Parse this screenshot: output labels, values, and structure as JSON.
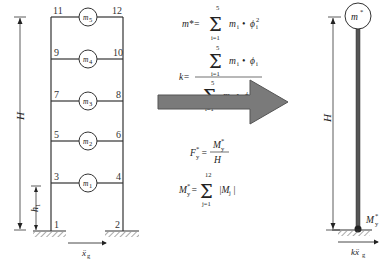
{
  "diagram": {
    "left_frame": {
      "node_labels": [
        "1",
        "2",
        "3",
        "4",
        "5",
        "6",
        "7",
        "8",
        "9",
        "10",
        "11",
        "12"
      ],
      "masses": [
        "m1",
        "m2",
        "m3",
        "m4",
        "m5"
      ],
      "mass_display": [
        {
          "main": "m",
          "sub": "1"
        },
        {
          "main": "m",
          "sub": "2"
        },
        {
          "main": "m",
          "sub": "3"
        },
        {
          "main": "m",
          "sub": "4"
        },
        {
          "main": "m",
          "sub": "5"
        }
      ],
      "height_label": "H",
      "first_storey_label": {
        "main": "h",
        "sub": "1"
      },
      "ground_motion_label": {
        "main": "ẍ",
        "sub": "g"
      }
    },
    "formulas": {
      "m_star": {
        "lhs": "m*=",
        "sum_top": "5",
        "sum_bottom": "i=1",
        "term": "m",
        "term_sub": "i",
        "dot": "•",
        "phi": "ϕ",
        "phi_sub": "i",
        "phi_sup": "2"
      },
      "k": {
        "lhs": "k=",
        "num_top": "5",
        "num_bottom": "i=1",
        "num_term": "m",
        "num_term_sub": "i",
        "num_phi": "ϕ",
        "num_phi_sub": "i",
        "den_top": "5",
        "den_bottom": "i=1",
        "den_term": "m",
        "den_term_sub": "i",
        "den_phi": "ϕ",
        "den_phi_sub": "i",
        "den_phi_sup": "2",
        "dot": "•"
      },
      "F_y": {
        "lhs_main": "F",
        "lhs_sup": "*",
        "lhs_sub": "y",
        "eq": "=",
        "num_main": "M",
        "num_sup": "*",
        "num_sub": "y",
        "den": "H"
      },
      "M_y": {
        "lhs_main": "M",
        "lhs_sup": "*",
        "lhs_sub": "y",
        "eq": "=",
        "sum_top": "12",
        "sum_bottom": "j=1",
        "term": "|M",
        "term_sub": "j",
        "term_end": "|"
      }
    },
    "arrow": {
      "color": "#7a7a7a",
      "stroke": "#555555"
    },
    "right_model": {
      "mass_label": {
        "main": "m",
        "sup": "*"
      },
      "height_label": "H",
      "moment_label": {
        "main": "M",
        "sup": "*",
        "sub": "y"
      },
      "ground_motion_label": {
        "main": "kẍ",
        "sub": "g"
      },
      "column_color": "#555555"
    }
  }
}
